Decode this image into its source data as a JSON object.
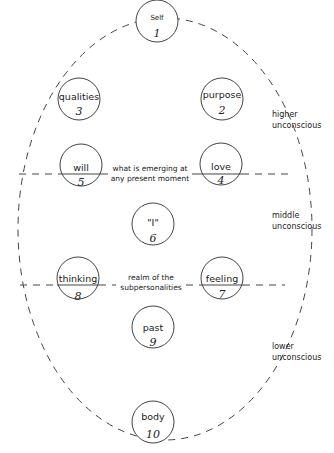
{
  "diagram": {
    "type": "egg-diagram",
    "nodes": [
      {
        "id": 1,
        "label": "Self",
        "number": "1"
      },
      {
        "id": 2,
        "label": "purpose",
        "number": "2"
      },
      {
        "id": 3,
        "label": "qualities",
        "number": "3"
      },
      {
        "id": 4,
        "label": "love",
        "number": "4"
      },
      {
        "id": 5,
        "label": "will",
        "number": "5"
      },
      {
        "id": 6,
        "label": "\"I\"",
        "number": "6"
      },
      {
        "id": 7,
        "label": "feeling",
        "number": "7"
      },
      {
        "id": 8,
        "label": "thinking",
        "number": "8"
      },
      {
        "id": 9,
        "label": "past",
        "number": "9"
      },
      {
        "id": 10,
        "label": "body",
        "number": "10"
      }
    ],
    "connector_labels": {
      "upper_line1": "what is emerging at",
      "upper_line2": "any present moment",
      "lower_line1": "realm of the",
      "lower_line2": "subpersonalities"
    },
    "regions": [
      {
        "line1": "higher",
        "line2": "unconscious"
      },
      {
        "line1": "middle",
        "line2": "unconscious"
      },
      {
        "line1": "lower",
        "line2": "unconscious"
      }
    ],
    "colors": {
      "stroke": "#333333",
      "text": "#222222",
      "background": "#ffffff"
    }
  }
}
